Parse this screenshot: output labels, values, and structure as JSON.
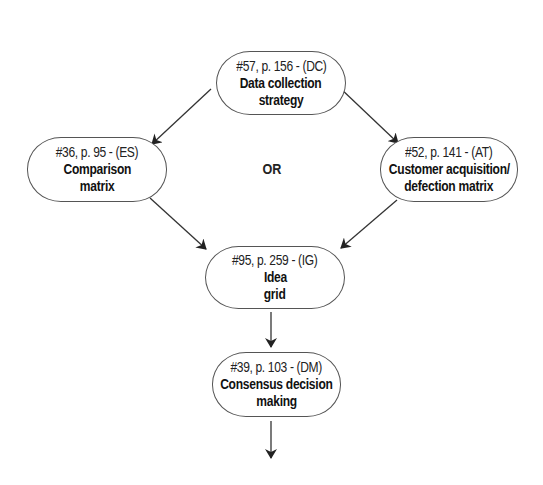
{
  "diagram": {
    "type": "flowchart",
    "nodes": [
      {
        "id": "DC",
        "ref": "#57, p. 156 - (DC)",
        "title_lines": [
          "Data collection",
          "strategy"
        ]
      },
      {
        "id": "ES",
        "ref": "#36, p. 95 - (ES)",
        "title_lines": [
          "Comparison",
          "matrix"
        ]
      },
      {
        "id": "AT",
        "ref": "#52, p. 141 - (AT)",
        "title_lines": [
          "Customer acquisition/",
          "defection matrix"
        ]
      },
      {
        "id": "IG",
        "ref": "#95, p. 259 - (IG)",
        "title_lines": [
          "Idea",
          "grid"
        ]
      },
      {
        "id": "DM",
        "ref": "#39, p. 103 - (DM)",
        "title_lines": [
          "Consensus decision",
          "making"
        ]
      }
    ],
    "branch_label": "OR",
    "edges": [
      {
        "from": "DC",
        "to": "ES"
      },
      {
        "from": "DC",
        "to": "AT"
      },
      {
        "from": "ES",
        "to": "IG"
      },
      {
        "from": "AT",
        "to": "IG"
      },
      {
        "from": "IG",
        "to": "DM"
      },
      {
        "from": "DM",
        "to": "next"
      }
    ],
    "colors": {
      "background": "#ffffff",
      "node_border": "#555555",
      "edge": "#222222",
      "text": "#1a1a1a"
    }
  }
}
